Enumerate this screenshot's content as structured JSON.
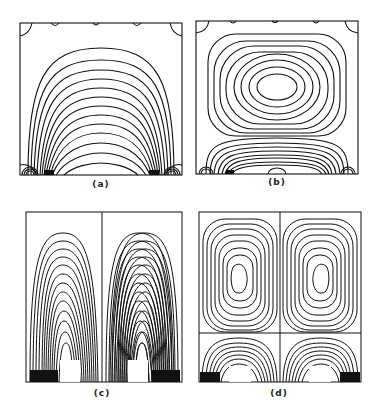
{
  "figure": {
    "panels": [
      {
        "id": "a",
        "label": "(a)",
        "description": "Single-cell contour pattern with arched isolines and small corner eddies"
      },
      {
        "id": "b",
        "label": "(b)",
        "description": "Single central vortex above a secondary cell of flattened arched contours"
      },
      {
        "id": "c",
        "label": "(c)",
        "description": "Symmetric double-cell arched contours divided by central line"
      },
      {
        "id": "d",
        "label": "(d)",
        "description": "Twin vortices above twin secondary cells divided by central line"
      }
    ]
  }
}
